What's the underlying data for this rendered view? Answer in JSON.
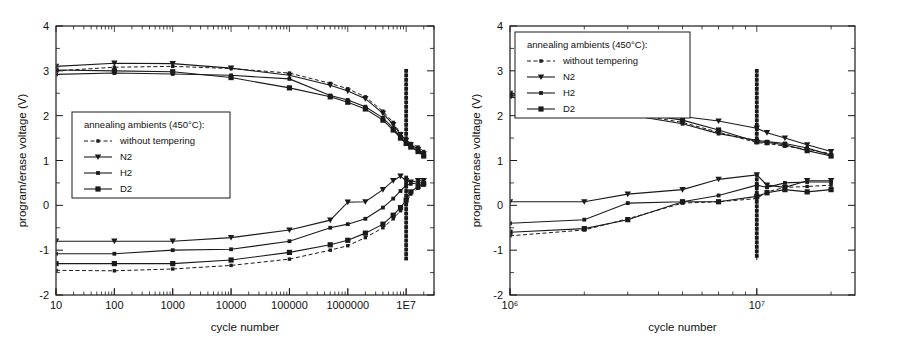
{
  "figure": {
    "panels": [
      "left",
      "right"
    ],
    "colors": {
      "ink": "#1a1a1a",
      "background": "#ffffff"
    }
  },
  "chart_data": [
    {
      "panel": "left",
      "type": "line",
      "title": "",
      "xlabel": "cycle number",
      "ylabel": "program/erase voltage (V)",
      "xscale": "log",
      "xlim": [
        10,
        30000000
      ],
      "ylim": [
        -2,
        4
      ],
      "yticks": [
        -2,
        -1,
        0,
        1,
        2,
        3,
        4
      ],
      "ytick_labels": [
        "-2",
        "-1",
        "0",
        "1",
        "2",
        "3",
        "4"
      ],
      "xticks": [
        10,
        100,
        1000,
        10000,
        100000,
        1000000,
        10000000
      ],
      "xtick_labels": [
        "10",
        "100",
        "1000",
        "10000",
        "100000",
        "1000000",
        "1E7"
      ],
      "grid": false,
      "legend_position": "center-left",
      "legend_title": "annealing ambients (450°C):",
      "series": [
        {
          "name": "without tempering",
          "marker": "x",
          "linestyle": "dotted",
          "program": {
            "x": [
              10,
              100,
              1000,
              10000,
              100000,
              500000,
              1000000,
              2000000,
              4000000,
              6000000,
              8000000,
              10000000,
              12000000,
              16000000,
              20000000
            ],
            "y": [
              3.0,
              3.08,
              3.1,
              3.05,
              2.95,
              2.72,
              2.6,
              2.42,
              2.1,
              1.85,
              1.6,
              1.45,
              1.38,
              1.3,
              1.2
            ]
          },
          "erase": {
            "x": [
              10,
              100,
              1000,
              10000,
              100000,
              500000,
              1000000,
              2000000,
              4000000,
              6000000,
              8000000,
              10000000,
              12000000,
              16000000,
              20000000
            ],
            "y": [
              -1.45,
              -1.46,
              -1.42,
              -1.34,
              -1.2,
              -1.0,
              -0.9,
              -0.72,
              -0.5,
              -0.3,
              -0.12,
              0.05,
              0.25,
              0.38,
              0.45
            ]
          }
        },
        {
          "name": "N2",
          "marker": "triangle-down",
          "linestyle": "solid",
          "program": {
            "x": [
              10,
              100,
              1000,
              10000,
              100000,
              500000,
              1000000,
              2000000,
              4000000,
              6000000,
              8000000,
              10000000,
              12000000,
              16000000,
              20000000
            ],
            "y": [
              3.1,
              3.17,
              3.16,
              3.06,
              2.9,
              2.68,
              2.55,
              2.38,
              2.05,
              1.8,
              1.58,
              1.45,
              1.35,
              1.25,
              1.15
            ]
          },
          "erase": {
            "x": [
              10,
              100,
              1000,
              10000,
              100000,
              500000,
              1000000,
              2000000,
              4000000,
              6000000,
              8000000,
              10000000,
              12000000,
              16000000,
              20000000
            ],
            "y": [
              -0.8,
              -0.8,
              -0.8,
              -0.72,
              -0.55,
              -0.33,
              0.07,
              0.08,
              0.35,
              0.55,
              0.65,
              0.55,
              0.52,
              0.55,
              0.55
            ]
          }
        },
        {
          "name": "H2",
          "marker": "square-small",
          "linestyle": "solid",
          "program": {
            "x": [
              10,
              100,
              1000,
              10000,
              100000,
              500000,
              1000000,
              2000000,
              4000000,
              6000000,
              8000000,
              10000000,
              12000000,
              16000000,
              20000000
            ],
            "y": [
              2.92,
              2.95,
              2.93,
              2.9,
              2.82,
              2.45,
              2.35,
              2.2,
              1.95,
              1.72,
              1.52,
              1.4,
              1.32,
              1.22,
              1.12
            ]
          },
          "erase": {
            "x": [
              10,
              100,
              1000,
              10000,
              100000,
              500000,
              1000000,
              2000000,
              4000000,
              6000000,
              8000000,
              10000000,
              12000000,
              16000000,
              20000000
            ],
            "y": [
              -1.08,
              -1.08,
              -1.0,
              -0.98,
              -0.8,
              -0.5,
              -0.42,
              -0.3,
              -0.05,
              0.15,
              0.32,
              0.45,
              0.48,
              0.5,
              0.5
            ]
          }
        },
        {
          "name": "D2",
          "marker": "square",
          "linestyle": "solid",
          "program": {
            "x": [
              10,
              100,
              1000,
              10000,
              100000,
              500000,
              1000000,
              2000000,
              4000000,
              6000000,
              8000000,
              10000000,
              12000000,
              16000000,
              20000000
            ],
            "y": [
              3.02,
              3.0,
              2.98,
              2.85,
              2.62,
              2.42,
              2.3,
              2.15,
              1.9,
              1.68,
              1.5,
              1.38,
              1.3,
              1.2,
              1.1
            ]
          },
          "erase": {
            "x": [
              10,
              100,
              1000,
              10000,
              100000,
              500000,
              1000000,
              2000000,
              4000000,
              6000000,
              8000000,
              10000000,
              12000000,
              16000000,
              20000000
            ],
            "y": [
              -1.3,
              -1.3,
              -1.3,
              -1.22,
              -1.05,
              -0.88,
              -0.78,
              -0.62,
              -0.42,
              -0.22,
              -0.05,
              0.12,
              0.3,
              0.42,
              0.48
            ]
          }
        }
      ],
      "annotations": [
        {
          "name": "burst-spike-program",
          "x": 10000000,
          "y_from": 1.38,
          "y_to": 3.0
        },
        {
          "name": "burst-spike-erase",
          "x": 10000000,
          "y_from": -1.2,
          "y_to": 0.62
        }
      ]
    },
    {
      "panel": "right",
      "type": "line",
      "title": "",
      "xlabel": "cycle number",
      "ylabel": "program/erase voltage (V)",
      "xscale": "log",
      "xlim": [
        1000000,
        25000000
      ],
      "ylim": [
        -2,
        4
      ],
      "yticks": [
        -2,
        -1,
        0,
        1,
        2,
        3,
        4
      ],
      "ytick_labels": [
        "-2",
        "-1",
        "0",
        "1",
        "2",
        "3",
        "4"
      ],
      "xticks": [
        1000000,
        10000000
      ],
      "xtick_labels": [
        "10⁶",
        "10⁷"
      ],
      "grid": false,
      "legend_position": "top-left",
      "legend_title": "annealing ambients (450°C):",
      "series": [
        {
          "name": "without tempering",
          "marker": "x",
          "linestyle": "dotted",
          "program": {
            "x": [
              1000000,
              2000000,
              3000000,
              5000000,
              7000000,
              10000000,
              11000000,
              13000000,
              16000000,
              20000000
            ],
            "y": [
              2.45,
              2.2,
              2.05,
              1.85,
              1.63,
              1.4,
              1.38,
              1.32,
              1.25,
              1.15
            ]
          },
          "erase": {
            "x": [
              1000000,
              2000000,
              3000000,
              5000000,
              7000000,
              10000000,
              11000000,
              13000000,
              16000000,
              20000000
            ],
            "y": [
              -0.68,
              -0.55,
              -0.3,
              0.05,
              0.08,
              0.15,
              0.3,
              0.4,
              0.42,
              0.45
            ]
          }
        },
        {
          "name": "N2",
          "marker": "triangle-down",
          "linestyle": "solid",
          "program": {
            "x": [
              1000000,
              2000000,
              3000000,
              5000000,
              7000000,
              10000000,
              11000000,
              13000000,
              16000000,
              20000000
            ],
            "y": [
              2.5,
              2.3,
              2.15,
              1.98,
              1.88,
              1.72,
              1.62,
              1.5,
              1.35,
              1.2
            ]
          },
          "erase": {
            "x": [
              1000000,
              2000000,
              3000000,
              5000000,
              7000000,
              10000000,
              11000000,
              13000000,
              16000000,
              20000000
            ],
            "y": [
              0.08,
              0.08,
              0.25,
              0.35,
              0.58,
              0.68,
              0.45,
              0.4,
              0.55,
              0.55
            ]
          }
        },
        {
          "name": "H2",
          "marker": "square-small",
          "linestyle": "solid",
          "program": {
            "x": [
              1000000,
              2000000,
              3000000,
              5000000,
              7000000,
              10000000,
              11000000,
              13000000,
              16000000,
              20000000
            ],
            "y": [
              2.42,
              2.18,
              2.02,
              1.82,
              1.6,
              1.45,
              1.42,
              1.38,
              1.28,
              1.12
            ]
          },
          "erase": {
            "x": [
              1000000,
              2000000,
              3000000,
              5000000,
              7000000,
              10000000,
              11000000,
              13000000,
              16000000,
              20000000
            ],
            "y": [
              -0.4,
              -0.32,
              0.05,
              0.08,
              0.22,
              0.45,
              0.4,
              0.5,
              0.52,
              0.52
            ]
          }
        },
        {
          "name": "D2",
          "marker": "square",
          "linestyle": "solid",
          "program": {
            "x": [
              1000000,
              2000000,
              3000000,
              5000000,
              7000000,
              10000000,
              11000000,
              13000000,
              16000000,
              20000000
            ],
            "y": [
              2.47,
              2.24,
              2.08,
              1.9,
              1.68,
              1.42,
              1.4,
              1.35,
              1.22,
              1.1
            ]
          },
          "erase": {
            "x": [
              1000000,
              2000000,
              3000000,
              5000000,
              7000000,
              10000000,
              11000000,
              13000000,
              16000000,
              20000000
            ],
            "y": [
              -0.6,
              -0.52,
              -0.32,
              0.08,
              0.08,
              0.2,
              0.28,
              0.35,
              0.3,
              0.35
            ]
          }
        }
      ],
      "annotations": [
        {
          "name": "burst-spike-program",
          "x": 10000000,
          "y_from": 1.4,
          "y_to": 3.0
        },
        {
          "name": "burst-spike-erase",
          "x": 10000000,
          "y_from": -1.22,
          "y_to": 0.68
        }
      ]
    }
  ]
}
